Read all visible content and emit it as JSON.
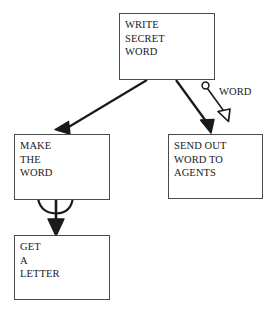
{
  "diagram": {
    "background_color": "#ffffff",
    "stroke_color": "#1a1a1a",
    "box_border_color": "#4a4a4a",
    "nodes": [
      {
        "id": "write-secret-word",
        "lines": [
          "WRITE",
          "SECRET",
          "WORD"
        ],
        "x": 119,
        "y": 13,
        "w": 96,
        "h": 67
      },
      {
        "id": "make-the-word",
        "lines": [
          "MAKE",
          "THE",
          "WORD"
        ],
        "x": 14,
        "y": 134,
        "w": 96,
        "h": 66
      },
      {
        "id": "send-out-word-to-agents",
        "lines": [
          "SEND OUT",
          "WORD TO",
          "AGENTS"
        ],
        "x": 168,
        "y": 134,
        "w": 95,
        "h": 65
      },
      {
        "id": "get-a-letter",
        "lines": [
          "GET",
          "A",
          "LETTER"
        ],
        "x": 14,
        "y": 235,
        "w": 96,
        "h": 65
      }
    ],
    "edges": [
      {
        "id": "write-to-make",
        "from": "write-secret-word",
        "to": "make-the-word",
        "label": "",
        "arrowhead": "solid"
      },
      {
        "id": "write-to-send",
        "from": "write-secret-word",
        "to": "send-out-word-to-agents",
        "label": "",
        "arrowhead": "solid"
      },
      {
        "id": "word-annotation",
        "from": "write-secret-word",
        "to": "send-out-word-to-agents",
        "label": "WORD",
        "arrowhead": "hollow",
        "start_marker": "circle"
      },
      {
        "id": "make-self-loop",
        "from": "make-the-word",
        "to": "make-the-word",
        "label": "",
        "arrowhead": "solid"
      },
      {
        "id": "make-to-get",
        "from": "make-the-word",
        "to": "get-a-letter",
        "label": "",
        "arrowhead": "solid"
      }
    ],
    "labels": {
      "word": "WORD"
    }
  }
}
